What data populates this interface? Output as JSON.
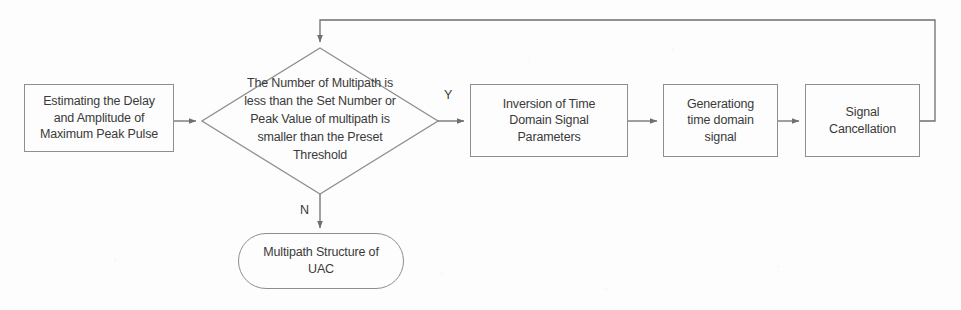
{
  "diagram": {
    "style": {
      "stroke": "#8e8e8e",
      "arrow_stroke": "#6f6f6f",
      "text": "#3a3a3a",
      "background": "#fdfdfd"
    },
    "nodes": [
      {
        "id": "estimate",
        "shape": "rectangle",
        "text": "Estimating the Delay and Amplitude of Maximum Peak Pulse",
        "lines": [
          "Estimating the Delay",
          "and Amplitude of",
          "Maximum Peak Pulse"
        ]
      },
      {
        "id": "decision",
        "shape": "diamond",
        "text": "The Number of Multipath is less than the Set Number or Peak Value of multipath is smaller than the Preset Threshold",
        "lines": [
          "The Number of Multipath is",
          "less than the Set Number or",
          "Peak Value of multipath is",
          "smaller than the Preset",
          "Threshold"
        ]
      },
      {
        "id": "inversion",
        "shape": "rectangle",
        "text": "Inversion of Time Domain Signal Parameters",
        "lines": [
          "Inversion of Time",
          "Domain Signal",
          "Parameters"
        ]
      },
      {
        "id": "generating",
        "shape": "rectangle",
        "text": "Generationg time domain signal",
        "lines": [
          "Generationg",
          "time domain",
          "signal"
        ]
      },
      {
        "id": "cancellation",
        "shape": "rectangle",
        "text": "Signal Cancellation",
        "lines": [
          "Signal",
          "Cancellation"
        ]
      },
      {
        "id": "result",
        "shape": "rounded-rectangle",
        "text": "Multipath Structure of UAC",
        "lines": [
          "Multipath Structure of",
          "UAC"
        ]
      }
    ],
    "edge_labels": {
      "yes": "Y",
      "no": "N"
    }
  }
}
